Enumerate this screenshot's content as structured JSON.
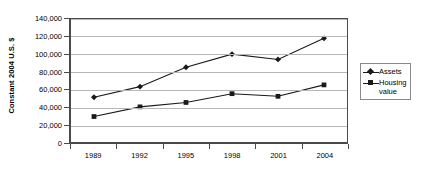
{
  "chart_data": {
    "type": "line",
    "title": "",
    "xlabel": "",
    "ylabel": "Constant 2004 U.S. $",
    "categories": [
      "1989",
      "1992",
      "1995",
      "1998",
      "2001",
      "2004"
    ],
    "series": [
      {
        "name": "Assets",
        "marker": "diamond",
        "color": "#1a1a1a",
        "values": [
          51000,
          63000,
          85000,
          100000,
          94000,
          118000
        ]
      },
      {
        "name": "Housing value",
        "marker": "square",
        "color": "#1a1a1a",
        "values": [
          29000,
          40000,
          45000,
          55000,
          52000,
          65000
        ]
      }
    ],
    "ylim": [
      0,
      140000
    ],
    "ytick_values": [
      0,
      20000,
      40000,
      60000,
      80000,
      100000,
      120000,
      140000
    ],
    "ytick_labels": [
      "0",
      "20,000",
      "40,000",
      "60,000",
      "80,000",
      "100,000",
      "120,000",
      "140,000"
    ],
    "grid": true,
    "grid_axis": "y",
    "legend_position": "right"
  },
  "legend": {
    "entries": [
      {
        "label": "Assets",
        "marker": "diamond"
      },
      {
        "label": "Housing\nvalue",
        "marker": "square"
      }
    ]
  },
  "colors": {
    "series_line": "#1a1a1a",
    "gridline": "#b7b7b7",
    "axis": "#4a4a4a",
    "background": "#ffffff",
    "text": "#000000"
  }
}
